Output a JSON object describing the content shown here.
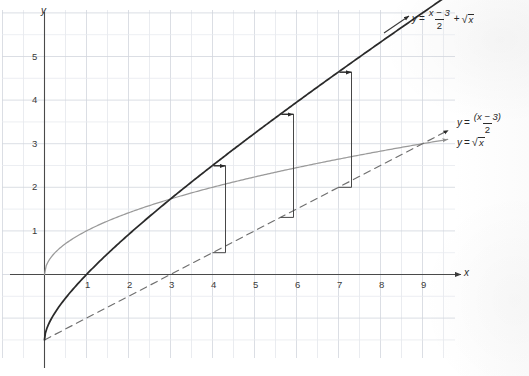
{
  "figure": {
    "kind": "cartesian-graph",
    "axes": {
      "x_label": "x",
      "y_label": "y",
      "x_ticks": [
        "1",
        "2",
        "3",
        "4",
        "5",
        "6",
        "7",
        "8",
        "9"
      ],
      "y_ticks": [
        "1",
        "2",
        "3",
        "4",
        "5"
      ],
      "x_range": [
        -1,
        9.8
      ],
      "y_range": [
        -2.2,
        6.2
      ],
      "grid": true,
      "grid_color": "#d9dde3",
      "axis_color": "#4a4a4a"
    },
    "curves": [
      {
        "id": "sum-curve",
        "expr_parts": {
          "y": "y",
          "eq": "=",
          "num": "x − 3",
          "den": "2",
          "plus": "+",
          "radical": "√",
          "arg": "x"
        },
        "label_plain": "y = (x - 3)/2 + √x",
        "color": "#2a2a2a",
        "style": "solid",
        "width": 1.7
      },
      {
        "id": "line-curve",
        "expr_parts": {
          "y": "y",
          "eq": "=",
          "num": "(x − 3)",
          "den": "2"
        },
        "label_plain": "y = (x - 3)/2",
        "color": "#6f6f6f",
        "style": "dashed",
        "width": 1.1
      },
      {
        "id": "sqrt-curve",
        "expr_parts": {
          "y": "y",
          "eq": "=",
          "radical": "√",
          "arg": "x"
        },
        "label_plain": "y = √x",
        "color": "#9a9a9a",
        "style": "solid",
        "width": 1.2
      }
    ],
    "annotations": {
      "description": "three vertical ordinate-addition brackets with arrows",
      "brackets": [
        {
          "x": 4.0,
          "from": "line",
          "to": "sum",
          "arrow_y_value": 2.25
        },
        {
          "x": 5.62,
          "from": "line",
          "to": "sum",
          "arrow_y_value": 3.05
        },
        {
          "x": 7.0,
          "from": "line",
          "to": "sum",
          "arrow_y_value": 3.65
        }
      ],
      "color": "#3d3d3d"
    }
  },
  "chart_data": {
    "type": "line",
    "title": "",
    "xlabel": "x",
    "ylabel": "y",
    "xlim": [
      -1,
      9.8
    ],
    "ylim": [
      -2.2,
      6.2
    ],
    "xticks": [
      1,
      2,
      3,
      4,
      5,
      6,
      7,
      8,
      9
    ],
    "yticks": [
      1,
      2,
      3,
      4,
      5
    ],
    "grid": true,
    "legend": "inline-labels-at-curve-ends",
    "series": [
      {
        "name": "y = (x - 3)/2 + √x",
        "style": "solid",
        "color": "#2a2a2a",
        "x": [
          0,
          0.5,
          1,
          1.5,
          2,
          2.5,
          3,
          3.5,
          4,
          4.5,
          5,
          5.5,
          6,
          6.5,
          7,
          7.5,
          8,
          8.5,
          9,
          9.5
        ],
        "y": [
          -1.5,
          -0.543,
          -0.5,
          0.475,
          0.914,
          1.331,
          1.732,
          2.121,
          2.5,
          2.871,
          3.236,
          3.596,
          3.949,
          4.299,
          4.646,
          4.989,
          5.328,
          5.665,
          6.0,
          6.332
        ]
      },
      {
        "name": "y = (x - 3)/2",
        "style": "dashed",
        "color": "#6f6f6f",
        "x": [
          0,
          1,
          2,
          3,
          4,
          5,
          6,
          7,
          8,
          9,
          9.6
        ],
        "y": [
          -1.5,
          -1.0,
          -0.5,
          0.0,
          0.5,
          1.0,
          1.5,
          2.0,
          2.5,
          3.0,
          3.3
        ]
      },
      {
        "name": "y = √x",
        "style": "solid",
        "color": "#9a9a9a",
        "x": [
          0,
          0.25,
          0.5,
          1,
          1.5,
          2,
          2.5,
          3,
          4,
          5,
          6,
          7,
          8,
          9,
          9.6
        ],
        "y": [
          0,
          0.5,
          0.707,
          1.0,
          1.225,
          1.414,
          1.581,
          1.732,
          2.0,
          2.236,
          2.449,
          2.646,
          2.828,
          3.0,
          3.098
        ]
      }
    ],
    "annotation_brackets": [
      {
        "x": 4.0,
        "lower_y": 0.5,
        "upper_y": 2.5,
        "delta": 2.0
      },
      {
        "x": 5.62,
        "lower_y": 1.31,
        "upper_y": 3.68,
        "delta": 2.37
      },
      {
        "x": 7.0,
        "lower_y": 2.0,
        "upper_y": 4.646,
        "delta": 2.646
      }
    ]
  },
  "labels": {
    "y_axis": "y",
    "x_axis": "x",
    "x_ticks": [
      {
        "v": "1"
      },
      {
        "v": "2"
      },
      {
        "v": "3"
      },
      {
        "v": "4"
      },
      {
        "v": "5"
      },
      {
        "v": "6"
      },
      {
        "v": "7"
      },
      {
        "v": "8"
      },
      {
        "v": "9"
      }
    ],
    "y_ticks": [
      {
        "v": "1"
      },
      {
        "v": "2"
      },
      {
        "v": "3"
      },
      {
        "v": "4"
      },
      {
        "v": "5"
      }
    ]
  }
}
